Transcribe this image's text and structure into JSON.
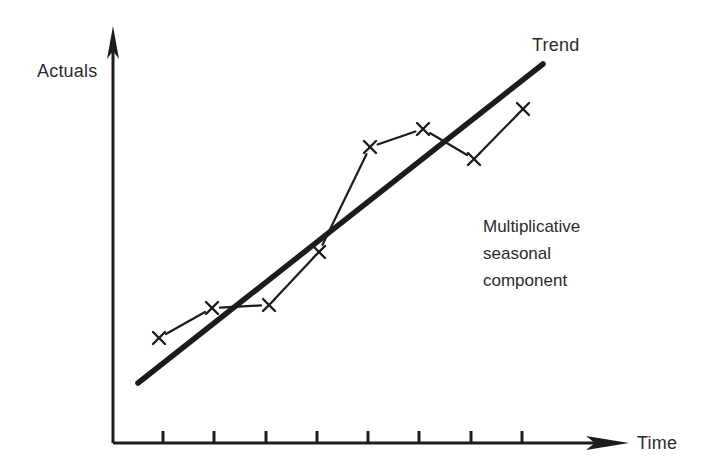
{
  "figure": {
    "title": "",
    "background": "#ffffff",
    "ink_color": "#1c1c1c",
    "text_color": "#2b2b2b"
  },
  "labels": {
    "y_axis": "Actuals",
    "x_axis": "Time",
    "trend": "Trend",
    "annotation_lines": [
      "Multiplicative",
      "seasonal",
      "component"
    ]
  },
  "chart_data": {
    "type": "line",
    "title": "",
    "xlabel": "Time",
    "ylabel": "Actuals",
    "xlim": [
      0,
      9
    ],
    "ylim": [
      0,
      10
    ],
    "grid": false,
    "legend_position": "inline-annotation",
    "axis_arrows": {
      "x": true,
      "y": true
    },
    "x_tick_count": 8,
    "x_tick_labels": [
      "",
      "",
      "",
      "",
      "",
      "",
      "",
      ""
    ],
    "y_tick_labels": [],
    "annotations": [
      {
        "text": "Trend",
        "x": 8.0,
        "y": 9.6
      },
      {
        "text": "Multiplicative seasonal component",
        "x": 7.2,
        "y": 5.4
      }
    ],
    "series": [
      {
        "name": "Trend",
        "style": "thick-straight-line",
        "marker": "none",
        "x": [
          0.5,
          8.4
        ],
        "y": [
          1.55,
          9.1
        ]
      },
      {
        "name": "Actuals",
        "style": "thin-line",
        "marker": "x",
        "x": [
          1,
          2,
          3,
          4,
          5,
          6,
          7,
          8
        ],
        "y": [
          2.6,
          3.3,
          3.4,
          4.6,
          7.0,
          7.4,
          6.7,
          7.9
        ]
      }
    ],
    "pixel_geometry": {
      "note": "pixel coordinates in the 709x476 figure space",
      "origin": [
        113,
        443
      ],
      "y_axis_top_arrow_tip": [
        113,
        27
      ],
      "x_axis_right_arrow_tip": [
        628,
        443
      ],
      "x_ticks_px": [
        163,
        214,
        266,
        317,
        368,
        419,
        471,
        522
      ],
      "tick_length_px": 12,
      "trend_line_px": [
        [
          138,
          383
        ],
        [
          543,
          64
        ]
      ],
      "actual_points_px": [
        [
          159,
          338
        ],
        [
          212,
          308
        ],
        [
          269,
          305
        ],
        [
          319,
          252
        ],
        [
          370,
          147
        ],
        [
          423,
          129
        ],
        [
          474,
          159
        ],
        [
          523,
          109
        ]
      ],
      "marker_size_px": 12
    }
  }
}
